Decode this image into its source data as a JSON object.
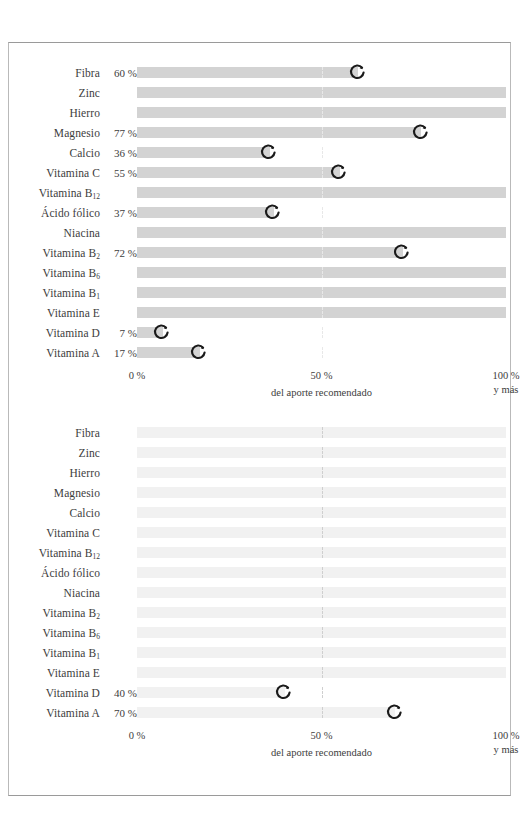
{
  "axis": {
    "tick_0": "0 %",
    "tick_50": "50 %",
    "tick_100": "100 %",
    "tick_100_sub": "y más",
    "title": "del aporte recomendado"
  },
  "marker_icon": "circle-arrow-marker",
  "colors": {
    "bar_chart1": "#d3d3d3",
    "bar_chart2": "#f1f1f1",
    "marker": "#1a1a1a",
    "text": "#3d3d3d",
    "frame": "#9a9a9a"
  },
  "chart_data": [
    {
      "type": "bar",
      "title": "",
      "xlabel": "del aporte recomendado",
      "ylabel": "",
      "xlim": [
        0,
        100
      ],
      "grid": true,
      "orientation": "horizontal",
      "categories": [
        "Fibra",
        "Zinc",
        "Hierro",
        "Magnesio",
        "Calcio",
        "Vitamina C",
        "Vitamina B12",
        "Ácido fólico",
        "Niacina",
        "Vitamina B2",
        "Vitamina B6",
        "Vitamina B1",
        "Vitamina E",
        "Vitamina D",
        "Vitamina A"
      ],
      "rows": [
        {
          "label": "Fibra",
          "sub": "",
          "value": 60,
          "value_label": "60 %"
        },
        {
          "label": "Zinc",
          "sub": "",
          "value": null,
          "value_label": ""
        },
        {
          "label": "Hierro",
          "sub": "",
          "value": null,
          "value_label": ""
        },
        {
          "label": "Magnesio",
          "sub": "",
          "value": 77,
          "value_label": "77 %"
        },
        {
          "label": "Calcio",
          "sub": "",
          "value": 36,
          "value_label": "36 %"
        },
        {
          "label": "Vitamina C",
          "sub": "",
          "value": 55,
          "value_label": "55 %"
        },
        {
          "label": "Vitamina B",
          "sub": "12",
          "value": null,
          "value_label": ""
        },
        {
          "label": "Ácido fólico",
          "sub": "",
          "value": 37,
          "value_label": "37 %"
        },
        {
          "label": "Niacina",
          "sub": "",
          "value": null,
          "value_label": ""
        },
        {
          "label": "Vitamina B",
          "sub": "2",
          "value": 72,
          "value_label": "72 %"
        },
        {
          "label": "Vitamina B",
          "sub": "6",
          "value": null,
          "value_label": ""
        },
        {
          "label": "Vitamina B",
          "sub": "1",
          "value": null,
          "value_label": ""
        },
        {
          "label": "Vitamina E",
          "sub": "",
          "value": null,
          "value_label": ""
        },
        {
          "label": "Vitamina D",
          "sub": "",
          "value": 7,
          "value_label": "7 %"
        },
        {
          "label": "Vitamina A",
          "sub": "",
          "value": 17,
          "value_label": "17 %"
        }
      ]
    },
    {
      "type": "bar",
      "title": "",
      "xlabel": "del aporte recomendado",
      "ylabel": "",
      "xlim": [
        0,
        100
      ],
      "grid": true,
      "orientation": "horizontal",
      "categories": [
        "Fibra",
        "Zinc",
        "Hierro",
        "Magnesio",
        "Calcio",
        "Vitamina C",
        "Vitamina B12",
        "Ácido fólico",
        "Niacina",
        "Vitamina B2",
        "Vitamina B6",
        "Vitamina B1",
        "Vitamina E",
        "Vitamina D",
        "Vitamina A"
      ],
      "rows": [
        {
          "label": "Fibra",
          "sub": "",
          "value": null,
          "value_label": ""
        },
        {
          "label": "Zinc",
          "sub": "",
          "value": null,
          "value_label": ""
        },
        {
          "label": "Hierro",
          "sub": "",
          "value": null,
          "value_label": ""
        },
        {
          "label": "Magnesio",
          "sub": "",
          "value": null,
          "value_label": ""
        },
        {
          "label": "Calcio",
          "sub": "",
          "value": null,
          "value_label": ""
        },
        {
          "label": "Vitamina C",
          "sub": "",
          "value": null,
          "value_label": ""
        },
        {
          "label": "Vitamina B",
          "sub": "12",
          "value": null,
          "value_label": ""
        },
        {
          "label": "Ácido fólico",
          "sub": "",
          "value": null,
          "value_label": ""
        },
        {
          "label": "Niacina",
          "sub": "",
          "value": null,
          "value_label": ""
        },
        {
          "label": "Vitamina B",
          "sub": "2",
          "value": null,
          "value_label": ""
        },
        {
          "label": "Vitamina B",
          "sub": "6",
          "value": null,
          "value_label": ""
        },
        {
          "label": "Vitamina B",
          "sub": "1",
          "value": null,
          "value_label": ""
        },
        {
          "label": "Vitamina E",
          "sub": "",
          "value": null,
          "value_label": ""
        },
        {
          "label": "Vitamina D",
          "sub": "",
          "value": 40,
          "value_label": "40 %"
        },
        {
          "label": "Vitamina A",
          "sub": "",
          "value": 70,
          "value_label": "70 %"
        }
      ]
    }
  ]
}
